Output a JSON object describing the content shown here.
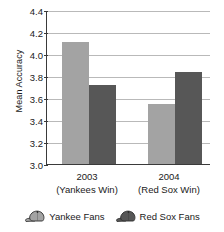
{
  "chart_data": {
    "type": "bar",
    "title": "",
    "xlabel": "",
    "ylabel": "Mean Accuracy",
    "ylim": [
      3.0,
      4.4
    ],
    "ytick_labels": [
      "4.4",
      "4.2",
      "4.0",
      "3.8",
      "3.6",
      "3.4",
      "3.2",
      "3.0"
    ],
    "ytick_values": [
      4.4,
      4.2,
      4.0,
      3.8,
      3.6,
      3.4,
      3.2,
      3.0
    ],
    "grid": true,
    "legend_position": "bottom",
    "categories": [
      "2003",
      "2004"
    ],
    "category_sublabels": [
      "(Yankees Win)",
      "(Red Sox Win)"
    ],
    "series": [
      {
        "name": "Yankee Fans",
        "color": "#a3a3a3",
        "icon": "baseball-cap-icon",
        "values": [
          4.11,
          3.55
        ]
      },
      {
        "name": "Red Sox Fans",
        "color": "#575757",
        "icon": "baseball-cap-icon",
        "values": [
          3.72,
          3.84
        ]
      }
    ]
  },
  "axis": {
    "line_color": "#3a3a3a",
    "grid_color": "#b9b9b9"
  }
}
